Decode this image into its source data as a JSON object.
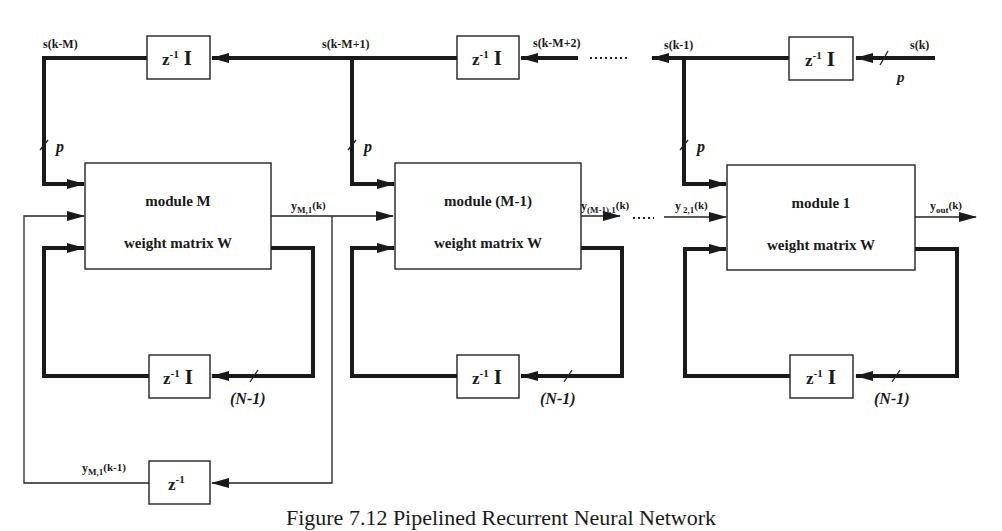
{
  "diagram": {
    "caption": "Figure 7.12  Pipelined Recurrent Neural Network",
    "top_delays": [
      {
        "label_z": "z",
        "label_exp": "-1",
        "label_I": "I"
      },
      {
        "label_z": "z",
        "label_exp": "-1",
        "label_I": "I"
      },
      {
        "label_z": "z",
        "label_exp": "-1",
        "label_I": "I"
      }
    ],
    "signals": {
      "s_k_minus_M": "s(k-M)",
      "s_k_minus_M_plus_1": "s(k-M+1)",
      "s_k_minus_M_plus_2": "s(k-M+2)",
      "s_k_minus_1": "s(k-1)",
      "s_k": "s(k)"
    },
    "bus_labels": {
      "p": "p",
      "n_minus_1": "(N-1)"
    },
    "modules": [
      {
        "title": "module  M",
        "subtitle": "weight matrix  W"
      },
      {
        "title": "module  (M-1)",
        "subtitle": "weight matrix  W"
      },
      {
        "title": "module  1",
        "subtitle": "weight matrix  W"
      }
    ],
    "outputs": {
      "yM1_base": "y",
      "yM1_sub": "M,1",
      "yM1_arg": "(k)",
      "yM1_1_base": "y",
      "yM1_1_sub": "(M-1),1",
      "yM1_1_arg": "(k)",
      "y21_base": "y",
      "y21_sub": "2,1",
      "y21_arg": "(k)",
      "yout_base": "y",
      "yout_sub": "out",
      "yout_arg": "(k)",
      "yM1_prev_base": "y",
      "yM1_prev_sub": "M,1",
      "yM1_prev_arg": "(k-1)"
    },
    "bottom_delay": {
      "label_z": "z",
      "label_exp": "-1"
    }
  }
}
